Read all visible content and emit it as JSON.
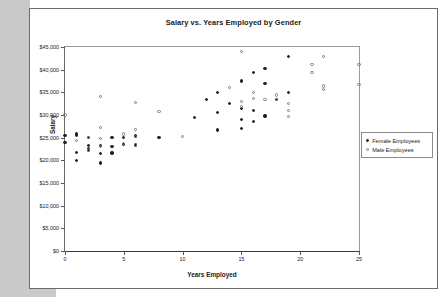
{
  "chart_data": {
    "type": "scatter",
    "title": "Salary vs. Years Employed by Gender",
    "xlabel": "Years Employed",
    "ylabel": "Salary",
    "xlim": [
      0,
      25
    ],
    "ylim": [
      0,
      45000
    ],
    "xticks": [
      "0",
      "5",
      "10",
      "15",
      "20",
      "25"
    ],
    "xtick_values": [
      0,
      5,
      10,
      15,
      20,
      25
    ],
    "yticks": [
      "$0",
      "$5,000",
      "$10,000",
      "$15,000",
      "$20,000",
      "$25,000",
      "$30,000",
      "$35,000",
      "$40,000",
      "$45,000"
    ],
    "ytick_values": [
      0,
      5000,
      10000,
      15000,
      20000,
      25000,
      30000,
      35000,
      40000,
      45000
    ],
    "grid": false,
    "legend_position": "right",
    "series": [
      {
        "name": "Female Employees",
        "marker": "filled-circle",
        "color": "#222222",
        "points": [
          [
            0,
            25500
          ],
          [
            0,
            23900
          ],
          [
            1,
            25900
          ],
          [
            1,
            25600
          ],
          [
            1,
            21800
          ],
          [
            1,
            20000
          ],
          [
            2,
            25000
          ],
          [
            2,
            23200
          ],
          [
            2,
            22600
          ],
          [
            2,
            22200
          ],
          [
            3,
            23200
          ],
          [
            3,
            21500
          ],
          [
            3,
            19400
          ],
          [
            4,
            25000
          ],
          [
            4,
            23000
          ],
          [
            4,
            21600
          ],
          [
            5,
            25000
          ],
          [
            5,
            23500
          ],
          [
            6,
            25500
          ],
          [
            6,
            25200
          ],
          [
            6,
            23400
          ],
          [
            8,
            25000
          ],
          [
            11,
            29500
          ],
          [
            12,
            33500
          ],
          [
            13,
            35000
          ],
          [
            13,
            30500
          ],
          [
            13,
            26700
          ],
          [
            14,
            32500
          ],
          [
            15,
            37500
          ],
          [
            15,
            31500
          ],
          [
            15,
            29000
          ],
          [
            15,
            27000
          ],
          [
            16,
            39300
          ],
          [
            16,
            31000
          ],
          [
            16,
            28500
          ],
          [
            17,
            40200
          ],
          [
            17,
            37000
          ],
          [
            17,
            29800
          ],
          [
            18,
            33400
          ],
          [
            19,
            42900
          ],
          [
            19,
            35000
          ]
        ]
      },
      {
        "name": "Male Employees",
        "marker": "hollow-circle",
        "color": "#777777",
        "points": [
          [
            0,
            30000
          ],
          [
            1,
            24400
          ],
          [
            2,
            25000
          ],
          [
            2,
            22300
          ],
          [
            3,
            34000
          ],
          [
            3,
            27200
          ],
          [
            3,
            24900
          ],
          [
            3,
            23100
          ],
          [
            5,
            25800
          ],
          [
            5,
            23700
          ],
          [
            6,
            32700
          ],
          [
            6,
            26800
          ],
          [
            6,
            25200
          ],
          [
            6,
            23400
          ],
          [
            8,
            30700
          ],
          [
            10,
            25300
          ],
          [
            14,
            36000
          ],
          [
            15,
            44000
          ],
          [
            15,
            33000
          ],
          [
            15,
            31800
          ],
          [
            16,
            34900
          ],
          [
            16,
            33700
          ],
          [
            17,
            33500
          ],
          [
            18,
            34400
          ],
          [
            18,
            33400
          ],
          [
            19,
            32500
          ],
          [
            19,
            31000
          ],
          [
            19,
            29700
          ],
          [
            21,
            41200
          ],
          [
            21,
            39300
          ],
          [
            22,
            42900
          ],
          [
            22,
            36400
          ],
          [
            22,
            35700
          ],
          [
            25,
            41200
          ],
          [
            25,
            36800
          ]
        ]
      }
    ]
  },
  "legend": {
    "items": [
      {
        "label": "Female Employees",
        "marker": "filled-circle"
      },
      {
        "label": "Male Employees",
        "marker": "hollow-circle"
      }
    ]
  }
}
